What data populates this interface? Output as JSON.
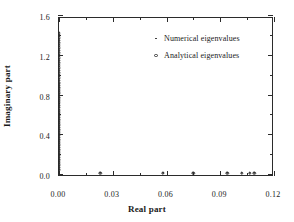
{
  "chart_data": {
    "type": "scatter",
    "title": "",
    "xlabel": "Real part",
    "ylabel": "Imaginary part",
    "xlim": [
      0.0,
      0.12
    ],
    "ylim": [
      0.0,
      1.6
    ],
    "xticks": [
      "0.00",
      "0.03",
      "0.06",
      "0.09",
      "0.12"
    ],
    "xtick_values": [
      0.0,
      0.03,
      0.06,
      0.09,
      0.12
    ],
    "yticks": [
      "0.0",
      "0.4",
      "0.8",
      "1.2",
      "1.6"
    ],
    "ytick_values": [
      0.0,
      0.4,
      0.8,
      1.2,
      1.6
    ],
    "x_minor_count": 1,
    "y_minor_count": 1,
    "grid": false,
    "legend_position": "upper center-right",
    "series": [
      {
        "name": "Numerical eigenvalues",
        "marker": "point",
        "color": "#262626",
        "points": [
          [
            0.0,
            0.055
          ],
          [
            0.0,
            0.075
          ],
          [
            0.0,
            0.095
          ],
          [
            0.0,
            0.115
          ],
          [
            0.0,
            0.135
          ],
          [
            0.0,
            0.155
          ],
          [
            0.0,
            0.175
          ],
          [
            0.0,
            0.195
          ],
          [
            0.0,
            0.215
          ],
          [
            0.0,
            0.235
          ],
          [
            0.0,
            0.255
          ],
          [
            0.0,
            0.275
          ],
          [
            0.0,
            0.295
          ],
          [
            0.0,
            0.315
          ],
          [
            0.0,
            0.335
          ],
          [
            0.0,
            0.355
          ],
          [
            0.0,
            0.375
          ],
          [
            0.0,
            0.395
          ],
          [
            0.0,
            0.415
          ],
          [
            0.0,
            0.435
          ],
          [
            0.0,
            0.455
          ],
          [
            0.0,
            0.475
          ],
          [
            0.0,
            0.495
          ],
          [
            0.0,
            0.515
          ],
          [
            0.0,
            0.535
          ],
          [
            0.0,
            0.555
          ],
          [
            0.0,
            0.575
          ],
          [
            0.0,
            0.595
          ],
          [
            0.0,
            0.615
          ],
          [
            0.0,
            0.635
          ],
          [
            0.0,
            0.655
          ],
          [
            0.0,
            0.675
          ],
          [
            0.0,
            0.695
          ],
          [
            0.0,
            0.715
          ],
          [
            0.0,
            0.735
          ],
          [
            0.0,
            0.755
          ],
          [
            0.0,
            0.775
          ],
          [
            0.0,
            0.795
          ],
          [
            0.0,
            0.815
          ],
          [
            0.0,
            0.835
          ],
          [
            0.0,
            0.855
          ],
          [
            0.0,
            0.875
          ],
          [
            0.0,
            0.895
          ],
          [
            0.0,
            0.915
          ],
          [
            0.0,
            0.935
          ],
          [
            0.0,
            0.955
          ],
          [
            0.0,
            0.975
          ],
          [
            0.0,
            0.995
          ],
          [
            0.0,
            1.015
          ],
          [
            0.0,
            1.035
          ],
          [
            0.0,
            1.055
          ],
          [
            0.0,
            1.075
          ],
          [
            0.0,
            1.095
          ],
          [
            0.0,
            1.115
          ],
          [
            0.0,
            1.135
          ],
          [
            0.0,
            1.155
          ],
          [
            0.0,
            1.175
          ],
          [
            0.0,
            1.195
          ],
          [
            0.0,
            1.215
          ],
          [
            0.0,
            1.235
          ],
          [
            0.0,
            1.255
          ],
          [
            0.0,
            1.275
          ],
          [
            0.0,
            1.295
          ],
          [
            0.0,
            1.315
          ],
          [
            0.0,
            1.335
          ],
          [
            0.0,
            1.355
          ],
          [
            0.0,
            1.375
          ],
          [
            0.0,
            1.395
          ],
          [
            0.0,
            1.415
          ],
          [
            0.0,
            1.435
          ],
          [
            0.023,
            0.02
          ],
          [
            0.058,
            0.02
          ],
          [
            0.075,
            0.02
          ],
          [
            0.094,
            0.02
          ],
          [
            0.102,
            0.02
          ],
          [
            0.1065,
            0.02
          ],
          [
            0.109,
            0.02
          ]
        ]
      },
      {
        "name": "Analytical eigenvalues",
        "marker": "circle-open",
        "color": "#3a3a3a",
        "points": [
          [
            0.0,
            0.055
          ],
          [
            0.0,
            0.08
          ],
          [
            0.0,
            0.105
          ],
          [
            0.0,
            0.13
          ],
          [
            0.0,
            0.155
          ],
          [
            0.0,
            0.18
          ],
          [
            0.0,
            0.205
          ],
          [
            0.0,
            0.23
          ],
          [
            0.0,
            0.255
          ],
          [
            0.0,
            0.28
          ],
          [
            0.0,
            0.305
          ],
          [
            0.0,
            0.33
          ],
          [
            0.0,
            0.355
          ],
          [
            0.0,
            0.38
          ],
          [
            0.0,
            0.405
          ],
          [
            0.0,
            0.43
          ],
          [
            0.0,
            0.455
          ],
          [
            0.0,
            0.48
          ],
          [
            0.0,
            0.505
          ],
          [
            0.0,
            0.53
          ],
          [
            0.0,
            0.555
          ],
          [
            0.0,
            0.58
          ],
          [
            0.0,
            0.605
          ],
          [
            0.0,
            0.63
          ],
          [
            0.0,
            0.655
          ],
          [
            0.0,
            0.68
          ],
          [
            0.0,
            0.705
          ],
          [
            0.0,
            0.73
          ],
          [
            0.0,
            0.755
          ],
          [
            0.0,
            0.78
          ],
          [
            0.0,
            0.805
          ],
          [
            0.0,
            0.83
          ],
          [
            0.0,
            0.855
          ],
          [
            0.0,
            0.88
          ],
          [
            0.0,
            0.905
          ],
          [
            0.0,
            0.93
          ],
          [
            0.0,
            0.955
          ],
          [
            0.0,
            0.98
          ],
          [
            0.0,
            1.005
          ],
          [
            0.0,
            1.03
          ],
          [
            0.0,
            1.055
          ],
          [
            0.0,
            1.08
          ],
          [
            0.0,
            1.105
          ],
          [
            0.0,
            1.13
          ],
          [
            0.0,
            1.155
          ],
          [
            0.0,
            1.18
          ],
          [
            0.0,
            1.205
          ],
          [
            0.0,
            1.23
          ],
          [
            0.0,
            1.255
          ],
          [
            0.0,
            1.28
          ],
          [
            0.0,
            1.305
          ],
          [
            0.0,
            1.33
          ],
          [
            0.0,
            1.355
          ],
          [
            0.0,
            1.38
          ],
          [
            0.0,
            1.405
          ],
          [
            0.0,
            1.43
          ],
          [
            0.023,
            0.02
          ],
          [
            0.058,
            0.02
          ],
          [
            0.075,
            0.02
          ],
          [
            0.094,
            0.02
          ],
          [
            0.102,
            0.02
          ],
          [
            0.1065,
            0.02
          ],
          [
            0.109,
            0.02
          ]
        ]
      }
    ],
    "legend": [
      {
        "label": "Numerical eigenvalues",
        "marker": "point"
      },
      {
        "label": "Analytical eigenvalues",
        "marker": "circle-open"
      }
    ]
  }
}
